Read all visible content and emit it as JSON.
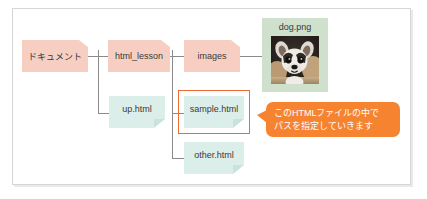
{
  "diagram": {
    "colors": {
      "folder_fill": "#f7cfc2",
      "file_fill": "#dceee9",
      "image_card_fill": "#cfe0cc",
      "callout_fill": "#f5832f",
      "highlight_border": "#ec6a34",
      "connector_line": "#8a8a8a",
      "frame_border": "#d6d6d6",
      "background": "#ffffff",
      "text": "#3a3a3a",
      "callout_text": "#ffffff"
    },
    "nodes": {
      "documents_folder": {
        "label": "ドキュメント",
        "type": "folder"
      },
      "html_lesson_folder": {
        "label": "html_lesson",
        "type": "folder"
      },
      "images_folder": {
        "label": "images",
        "type": "folder"
      },
      "up_html_file": {
        "label": "up.html",
        "type": "file"
      },
      "sample_html_file": {
        "label": "sample.html",
        "type": "file",
        "highlighted": true
      },
      "other_html_file": {
        "label": "other.html",
        "type": "file"
      },
      "dog_png_image": {
        "label": "dog.png",
        "type": "image-card",
        "photo_alt": "chihuahua-photo"
      }
    },
    "callout": {
      "line1": "このHTMLファイルの中で",
      "line2": "パスを指定していきます"
    }
  }
}
